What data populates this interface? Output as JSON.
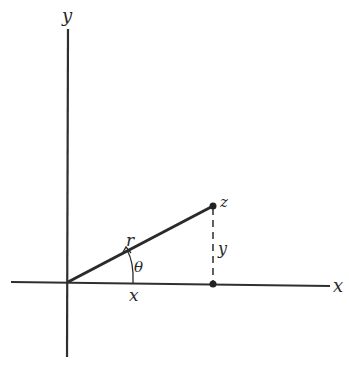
{
  "diagram": {
    "type": "polar-coordinates-of-complex-number",
    "labels": {
      "y_axis": "y",
      "x_axis": "x",
      "point": "z",
      "radius": "r",
      "angle": "θ",
      "x_component": "x",
      "y_component": "y"
    },
    "colors": {
      "ink": "#2a2a2a",
      "background": "#ffffff"
    }
  }
}
